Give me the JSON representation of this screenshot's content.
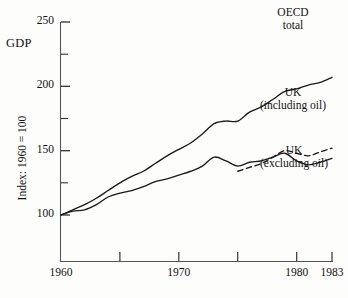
{
  "chart_data": {
    "type": "line",
    "title": "",
    "xlabel": "",
    "ylabel": "Index: 1960 = 100",
    "corner_label": "GDP",
    "xlim": [
      1960,
      1983
    ],
    "ylim": [
      85,
      255
    ],
    "grid": false,
    "legend_position": "inline-right",
    "y_ticks_labeled": [
      100,
      150,
      200,
      250
    ],
    "y_ticks_minor": [
      125,
      175,
      225
    ],
    "x_ticks_labeled": [
      1960,
      1970,
      1980,
      1983
    ],
    "x_ticks_minor": [
      1965,
      1975
    ],
    "series": [
      {
        "name": "OECD total",
        "label_lines": [
          "OECD",
          "total"
        ],
        "style": "solid",
        "x": [
          1960,
          1961,
          1962,
          1963,
          1964,
          1965,
          1966,
          1967,
          1968,
          1969,
          1970,
          1971,
          1972,
          1973,
          1974,
          1975,
          1976,
          1977,
          1978,
          1979,
          1980,
          1981,
          1982,
          1983
        ],
        "values": [
          100,
          104,
          108,
          113,
          119,
          125,
          130,
          134,
          140,
          146,
          151,
          156,
          163,
          171,
          173,
          173,
          180,
          184,
          190,
          196,
          198,
          201,
          203,
          207
        ]
      },
      {
        "name": "UK (including oil)",
        "label_lines": [
          "UK",
          "(including oil)"
        ],
        "style": "dashed",
        "x": [
          1975,
          1976,
          1977,
          1978,
          1979,
          1980,
          1981,
          1982,
          1983
        ],
        "values": [
          134,
          137,
          140,
          145,
          150,
          148,
          146,
          149,
          152
        ]
      },
      {
        "name": "UK (excluding oil)",
        "label_lines": [
          "UK",
          "(excluding oil)"
        ],
        "style": "solid",
        "x": [
          1960,
          1961,
          1962,
          1963,
          1964,
          1965,
          1966,
          1967,
          1968,
          1969,
          1970,
          1971,
          1972,
          1973,
          1974,
          1975,
          1976,
          1977,
          1978,
          1979,
          1980,
          1981,
          1982,
          1983
        ],
        "values": [
          100,
          103,
          104,
          108,
          114,
          117,
          119,
          122,
          126,
          128,
          131,
          134,
          138,
          145,
          142,
          138,
          141,
          142,
          145,
          148,
          142,
          139,
          141,
          144
        ]
      }
    ]
  },
  "axis": {
    "y_labels": [
      "250",
      "200",
      "150",
      "100"
    ],
    "x_labels": [
      "1960",
      "1970",
      "1980",
      "1983"
    ],
    "gdp": "GDP",
    "index_title": "Index: 1960 = 100"
  },
  "colors": {
    "line": "#1a1a1a",
    "axis": "#555555",
    "background": "#fdfdfb"
  }
}
